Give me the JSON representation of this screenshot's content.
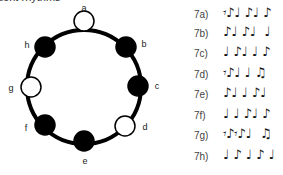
{
  "title": "dent rhythms",
  "circle": {
    "center": [
      84,
      87
    ],
    "radius": 57,
    "nodes": [
      {
        "label": "a",
        "x": 84,
        "y": 21,
        "filled": false,
        "lx": 84,
        "ly": 11
      },
      {
        "label": "b",
        "x": 126,
        "y": 47,
        "filled": true,
        "lx": 144,
        "ly": 47
      },
      {
        "label": "c",
        "x": 138,
        "y": 86,
        "filled": true,
        "lx": 157,
        "ly": 89
      },
      {
        "label": "d",
        "x": 125,
        "y": 126,
        "filled": false,
        "lx": 145,
        "ly": 130
      },
      {
        "label": "e",
        "x": 84,
        "y": 141,
        "filled": true,
        "lx": 85,
        "ly": 164
      },
      {
        "label": "f",
        "x": 45,
        "y": 125,
        "filled": true,
        "lx": 26,
        "ly": 131
      },
      {
        "label": "g",
        "x": 31,
        "y": 87,
        "filled": false,
        "lx": 11,
        "ly": 91
      },
      {
        "label": "h",
        "x": 45,
        "y": 47,
        "filled": true,
        "lx": 27,
        "ly": 48
      }
    ]
  },
  "exercises": [
    {
      "num": "7a)",
      "rhythm": "𝄾♪♩ ♪♩ ♪"
    },
    {
      "num": "7b)",
      "rhythm": "♪♩ ♪♩  ♩"
    },
    {
      "num": "7c)",
      "rhythm": "♩ ♪♩ ♩ ♪"
    },
    {
      "num": "7d)",
      "rhythm": "𝄾♪♩ ♩ ♫"
    },
    {
      "num": "7e)",
      "rhythm": "♪♩ ♩ ♪♩"
    },
    {
      "num": "7f)",
      "rhythm": "♩ ♩ ♪♩ ♪"
    },
    {
      "num": "7g)",
      "rhythm": "𝄾♪𝄾♪♩  ♫"
    },
    {
      "num": "7h)",
      "rhythm": "♩ ♪ ♩ ♪ ♩"
    }
  ]
}
